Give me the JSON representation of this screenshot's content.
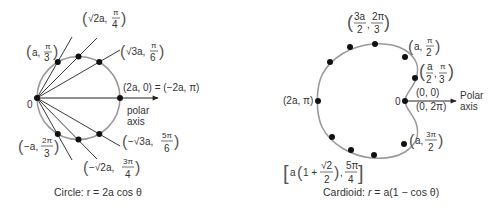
{
  "colors": {
    "curve": "#9a9a9a",
    "ray": "#222222",
    "dot": "#111111",
    "text": "#333333",
    "background": "#ffffff"
  },
  "left_figure": {
    "caption": "Circle: r = 2a cos θ",
    "origin_label": "0",
    "axis_label_line1": "polar",
    "axis_label_line2": "axis",
    "points": [
      {
        "label": "(a, π/3)",
        "r_text": "a",
        "theta_num": "π",
        "theta_den": "3"
      },
      {
        "label": "(√2a, π/4)",
        "r_text": "√2a",
        "theta_num": "π",
        "theta_den": "4"
      },
      {
        "label": "(√3a, π/6)",
        "r_text": "√3a",
        "theta_num": "π",
        "theta_den": "6"
      },
      {
        "label": "(2a, 0) = (−2a, π)",
        "text": "(2a, 0) = (−2a, π)"
      },
      {
        "label": "(−√3a, 5π/6)",
        "r_text": "−√3a",
        "theta_num": "5π",
        "theta_den": "6"
      },
      {
        "label": "(−√2a, 3π/4)",
        "r_text": "−√2a",
        "theta_num": "3π",
        "theta_den": "4"
      },
      {
        "label": "(−a, 2π/3)",
        "r_text": "−a",
        "theta_num": "2π",
        "theta_den": "3"
      }
    ]
  },
  "right_figure": {
    "caption_prefix": "Cardioid: ",
    "caption_r": "r",
    "caption_rest": " = a(1 − cos θ)",
    "origin_label": "0",
    "axis_label_line1": "Polar",
    "axis_label_line2": "axis",
    "points": [
      {
        "label": "(3a/2, 2π/3)",
        "r_num": "3a",
        "r_den": "2",
        "theta_num": "2π",
        "theta_den": "3"
      },
      {
        "label": "(a, π/2)",
        "r_text": "a",
        "theta_num": "π",
        "theta_den": "2"
      },
      {
        "label": "(a/2, π/3)",
        "r_num": "a",
        "r_den": "2",
        "theta_num": "π",
        "theta_den": "3"
      },
      {
        "label": "(0, 0)",
        "text": "(0, 0)"
      },
      {
        "label": "(0, 2π)",
        "text": "(0, 2π)"
      },
      {
        "label": "(2a, π)",
        "text": "(2a, π)"
      },
      {
        "label": "(a, 3π/2)",
        "r_text": "a",
        "theta_num": "3π",
        "theta_den": "2"
      },
      {
        "label": "[a(1 + √2/2), 5π/4]",
        "r_text": "a(1 + √2/2)",
        "theta_num": "5π",
        "theta_den": "4"
      }
    ]
  }
}
